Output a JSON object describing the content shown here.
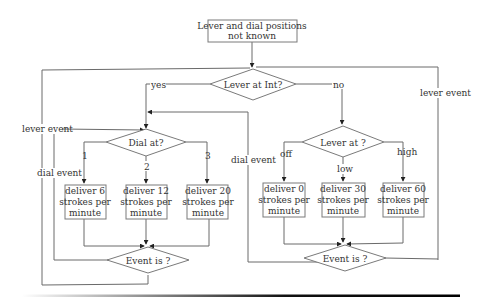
{
  "diagram": {
    "type": "flowchart",
    "start_box": {
      "line1": "Lever and dial positions",
      "line2": "not known"
    },
    "decisions": {
      "lever_int": "Lever at Int?",
      "dial_at": "Dial at?",
      "lever_at": "Lever at ?",
      "event_left": "Event is ?",
      "event_right": "Event is ?"
    },
    "edge_labels": {
      "yes": "yes",
      "no": "no",
      "dial_1": "1",
      "dial_2": "2",
      "dial_3": "3",
      "lever_off": "off",
      "lever_low": "low",
      "lever_high": "high",
      "lever_event_left": "lever event",
      "dial_event_left": "dial event",
      "dial_event_mid": "dial event",
      "lever_event_right": "lever event"
    },
    "action_boxes": [
      {
        "line1": "deliver 6",
        "line2": "strokes per",
        "line3": "minute"
      },
      {
        "line1": "deliver 12",
        "line2": "strokes per",
        "line3": "minute"
      },
      {
        "line1": "deliver 20",
        "line2": "strokes per",
        "line3": "minute"
      },
      {
        "line1": "deliver 0",
        "line2": "strokes per",
        "line3": "minute"
      },
      {
        "line1": "deliver 30",
        "line2": "strokes per",
        "line3": "minute"
      },
      {
        "line1": "deliver 60",
        "line2": "strokes per",
        "line3": "minute"
      }
    ]
  }
}
